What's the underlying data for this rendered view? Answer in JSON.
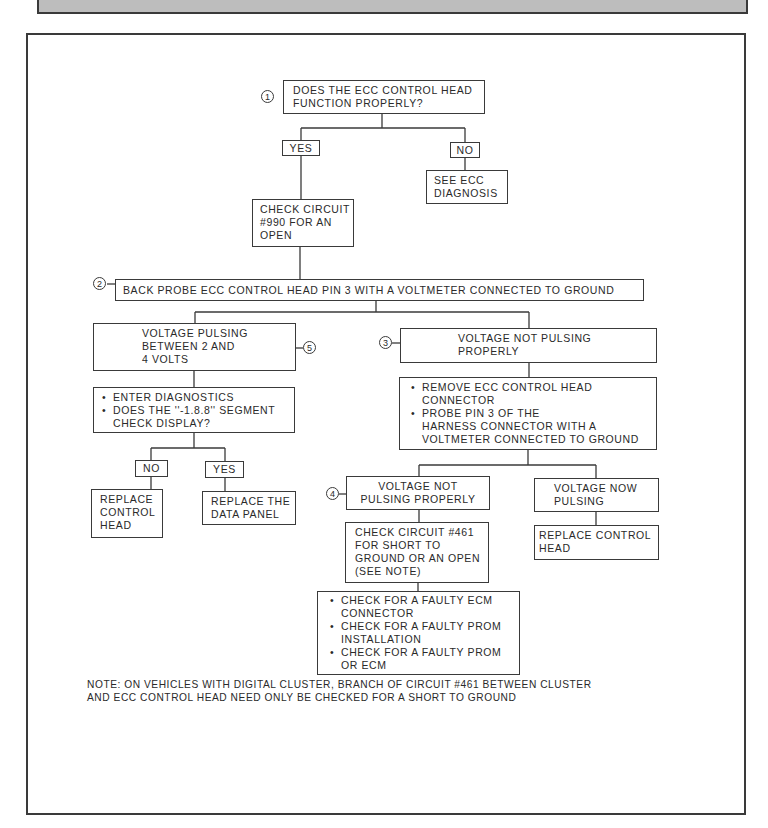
{
  "figure": {
    "nodes": {
      "q1": {
        "number": "1",
        "text": [
          "DOES THE ECC CONTROL HEAD",
          "FUNCTION PROPERLY?"
        ]
      },
      "q1_yes": {
        "label": "YES"
      },
      "q1_no": {
        "label": "NO"
      },
      "see_ecc": {
        "text": [
          "SEE ECC",
          "DIAGNOSIS"
        ]
      },
      "check_990": {
        "text": [
          "CHECK CIRCUIT",
          "#990 FOR AN",
          "OPEN"
        ]
      },
      "step2": {
        "number": "2",
        "text": "BACK PROBE ECC CONTROL HEAD PIN 3 WITH A VOLTMETER CONNECTED TO GROUND"
      },
      "pulsing": {
        "number": "5",
        "text": [
          "VOLTAGE PULSING",
          "BETWEEN 2 AND",
          "4 VOLTS"
        ]
      },
      "not_pulsing_3": {
        "number": "3",
        "text": [
          "VOLTAGE NOT PULSING",
          "PROPERLY"
        ]
      },
      "enter_diag": {
        "bullets": [
          "ENTER DIAGNOSTICS",
          "DOES THE ''-1.8.8'' SEGMENT"
        ],
        "cont": "CHECK DISPLAY?"
      },
      "remove_ecc": {
        "bullets": [
          [
            "REMOVE ECC CONTROL HEAD",
            "CONNECTOR"
          ],
          [
            "PROBE PIN 3 OF THE",
            "HARNESS CONNECTOR WITH A",
            "VOLTMETER CONNECTED TO GROUND"
          ]
        ]
      },
      "diag_no": {
        "label": "NO"
      },
      "diag_yes": {
        "label": "YES"
      },
      "replace_head_left": {
        "text": [
          "REPLACE",
          "CONTROL",
          "HEAD"
        ]
      },
      "replace_data_panel": {
        "text": [
          "REPLACE THE",
          "DATA PANEL"
        ]
      },
      "not_pulsing_4": {
        "number": "4",
        "text": [
          "VOLTAGE NOT",
          "PULSING PROPERLY"
        ]
      },
      "now_pulsing": {
        "text": [
          "VOLTAGE NOW",
          "PULSING"
        ]
      },
      "check_461": {
        "text": [
          "CHECK CIRCUIT #461",
          "FOR SHORT TO",
          "GROUND OR AN OPEN",
          "(SEE NOTE)"
        ]
      },
      "replace_head_right": {
        "text": [
          "REPLACE CONTROL",
          "HEAD"
        ]
      },
      "faulty": {
        "bullets": [
          [
            "CHECK FOR A FAULTY ECM",
            "CONNECTOR"
          ],
          [
            "CHECK FOR A FAULTY PROM",
            "INSTALLATION"
          ],
          [
            "CHECK FOR A FAULTY PROM",
            "OR ECM"
          ]
        ]
      }
    },
    "note": [
      "NOTE: ON VEHICLES WITH DIGITAL CLUSTER, BRANCH OF CIRCUIT #461 BETWEEN CLUSTER",
      "AND ECC CONTROL HEAD NEED ONLY BE CHECKED FOR A SHORT TO GROUND"
    ],
    "colors": {
      "ink": "#3a3a3a",
      "band": "#bdbdbd",
      "paper": "#ffffff"
    }
  }
}
